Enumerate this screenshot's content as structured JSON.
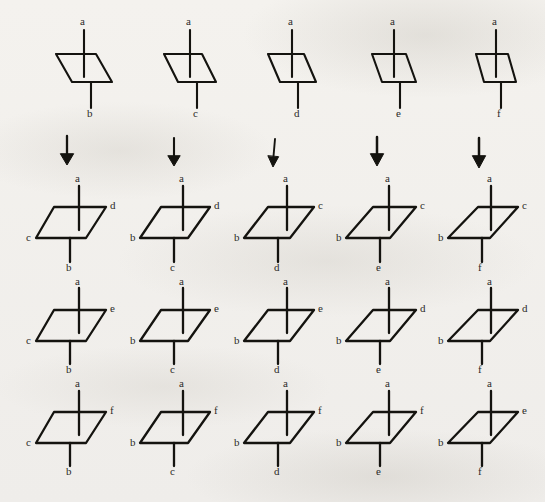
{
  "figure": {
    "background_color": "#f2f0ec",
    "ink_color": "#14130f",
    "columns": 5,
    "rows": 4,
    "arrow_glyph": "downward-arrow",
    "arrow_count": 5
  },
  "labels": {
    "top": "a",
    "bottoms": [
      "b",
      "c",
      "d",
      "e",
      "f"
    ]
  },
  "rows": [
    {
      "name": "row-1-unlabeled-sides",
      "cells": [
        {
          "top": "a",
          "bottom": "b",
          "left": "",
          "right": ""
        },
        {
          "top": "a",
          "bottom": "c",
          "left": "",
          "right": ""
        },
        {
          "top": "a",
          "bottom": "d",
          "left": "",
          "right": ""
        },
        {
          "top": "a",
          "bottom": "e",
          "left": "",
          "right": ""
        },
        {
          "top": "a",
          "bottom": "f",
          "left": "",
          "right": ""
        }
      ]
    },
    {
      "name": "row-2",
      "cells": [
        {
          "top": "a",
          "bottom": "b",
          "left": "c",
          "right": "d"
        },
        {
          "top": "a",
          "bottom": "c",
          "left": "b",
          "right": "d"
        },
        {
          "top": "a",
          "bottom": "d",
          "left": "b",
          "right": "c"
        },
        {
          "top": "a",
          "bottom": "e",
          "left": "b",
          "right": "c"
        },
        {
          "top": "a",
          "bottom": "f",
          "left": "b",
          "right": "c"
        }
      ]
    },
    {
      "name": "row-3",
      "cells": [
        {
          "top": "a",
          "bottom": "b",
          "left": "c",
          "right": "e"
        },
        {
          "top": "a",
          "bottom": "c",
          "left": "b",
          "right": "e"
        },
        {
          "top": "a",
          "bottom": "d",
          "left": "b",
          "right": "e"
        },
        {
          "top": "a",
          "bottom": "e",
          "left": "b",
          "right": "d"
        },
        {
          "top": "a",
          "bottom": "f",
          "left": "b",
          "right": "d"
        }
      ]
    },
    {
      "name": "row-4",
      "cells": [
        {
          "top": "a",
          "bottom": "b",
          "left": "c",
          "right": "f"
        },
        {
          "top": "a",
          "bottom": "c",
          "left": "b",
          "right": "f"
        },
        {
          "top": "a",
          "bottom": "d",
          "left": "b",
          "right": "f"
        },
        {
          "top": "a",
          "bottom": "e",
          "left": "b",
          "right": "f"
        },
        {
          "top": "a",
          "bottom": "f",
          "left": "b",
          "right": "e"
        }
      ]
    }
  ]
}
